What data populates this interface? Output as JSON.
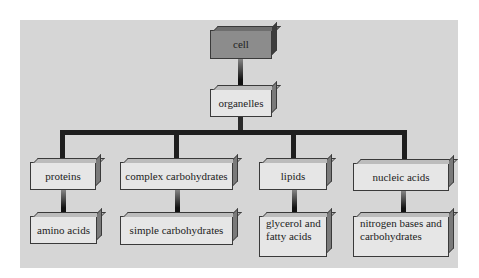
{
  "diagram": {
    "type": "hierarchy",
    "root": {
      "label": "cell",
      "child": {
        "label": "organelles",
        "children": [
          {
            "label": "proteins",
            "child": {
              "label": "amino acids"
            }
          },
          {
            "label": "complex carbohydrates",
            "child": {
              "label": "simple carbohydrates"
            }
          },
          {
            "label": "lipids",
            "child": {
              "label": "glycerol and fatty acids",
              "lines": [
                "glycerol and",
                "fatty acids"
              ]
            }
          },
          {
            "label": "nucleic acids",
            "child": {
              "label": "nitrogen bases and carbohydrates",
              "lines": [
                "nitrogen bases and",
                "carbohydrates"
              ]
            }
          }
        ]
      }
    },
    "colors": {
      "background": "#d6d6d6",
      "box_fill": "#e6e6e6",
      "root_fill": "#8c8c8c",
      "connector": "#1e1e1e"
    }
  }
}
